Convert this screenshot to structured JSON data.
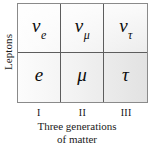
{
  "figure": {
    "row_axis_label": "Leptons",
    "caption_line1": "Three generations",
    "caption_line2": "of matter",
    "colors": {
      "border": "#8a8a8a",
      "gridline": "#5d5d5d",
      "text": "#111111",
      "fill_light": "#fcfcfc",
      "fill_dark": "#e2e2e2"
    }
  },
  "table": {
    "generations": [
      "I",
      "II",
      "III"
    ],
    "rows": [
      {
        "name": "neutrinos",
        "cells": [
          {
            "symbol": "ν",
            "subscript": "e"
          },
          {
            "symbol": "ν",
            "subscript": "μ"
          },
          {
            "symbol": "ν",
            "subscript": "τ"
          }
        ]
      },
      {
        "name": "charged-leptons",
        "cells": [
          {
            "symbol": "e",
            "subscript": ""
          },
          {
            "symbol": "μ",
            "subscript": ""
          },
          {
            "symbol": "τ",
            "subscript": ""
          }
        ]
      }
    ]
  }
}
